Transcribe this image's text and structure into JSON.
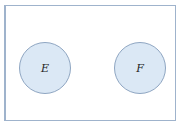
{
  "diagram": {
    "type": "venn",
    "universe": {
      "label": ""
    },
    "sets": [
      {
        "label": "E",
        "fill": "#dbe8f5",
        "stroke": "#8fa6c2"
      },
      {
        "label": "F",
        "fill": "#dbe8f5",
        "stroke": "#8fa6c2"
      }
    ],
    "relationship": "disjoint"
  }
}
